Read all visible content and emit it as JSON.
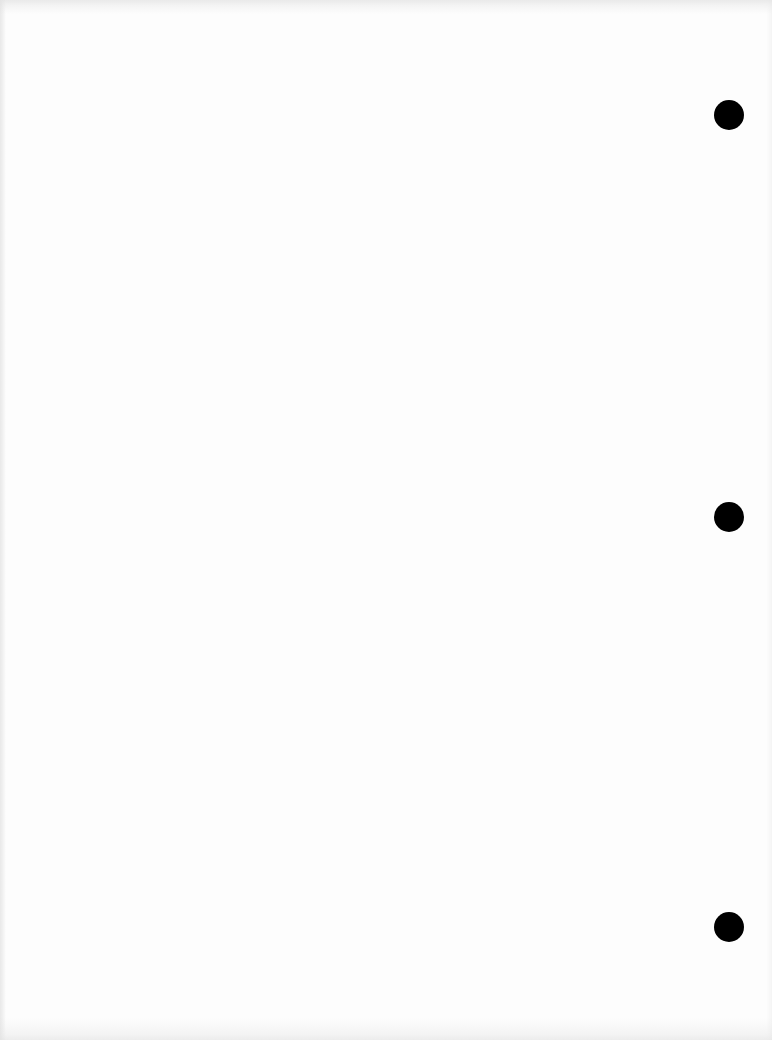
{
  "page": {
    "type": "blank scanned page",
    "background_color": "#fdfdfd",
    "text": ""
  },
  "punch_holes": [
    {
      "name": "top-hole",
      "cx": 729,
      "cy": 115,
      "diameter": 30,
      "color": "#000000"
    },
    {
      "name": "middle-hole",
      "cx": 729,
      "cy": 517,
      "diameter": 30,
      "color": "#000000"
    },
    {
      "name": "bottom-hole",
      "cx": 729,
      "cy": 927,
      "diameter": 30,
      "color": "#000000"
    }
  ]
}
